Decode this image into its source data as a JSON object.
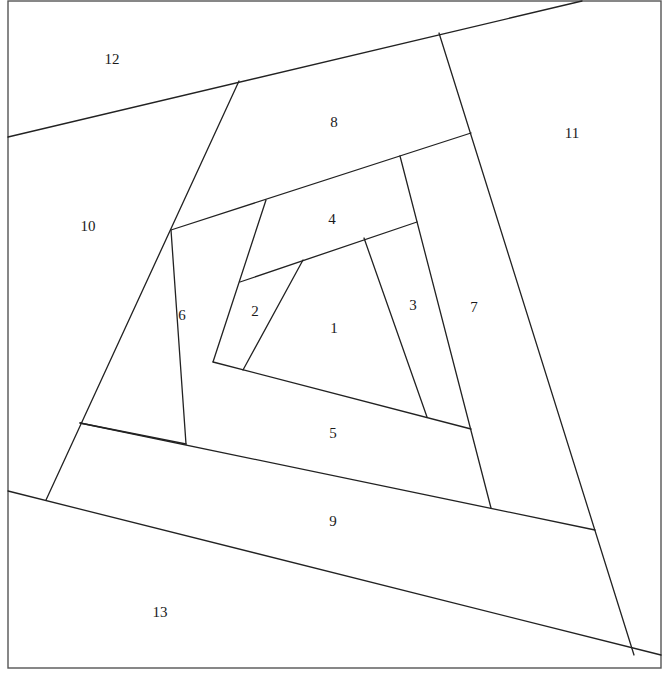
{
  "diagram": {
    "type": "log-cabin-spiral-quilt-block",
    "width": 671,
    "height": 674,
    "line_color": "#222222",
    "background": "#ffffff",
    "frame": {
      "x": 8,
      "y": 1,
      "w": 653,
      "h": 667
    },
    "segments": [
      [
        303,
        260,
        243,
        370
      ],
      [
        364,
        238,
        427,
        417
      ],
      [
        240,
        282,
        417,
        222
      ],
      [
        266,
        200,
        213,
        362
      ],
      [
        213,
        362,
        471,
        429
      ],
      [
        400,
        156,
        491,
        508
      ],
      [
        171,
        230,
        471,
        133
      ],
      [
        171,
        230,
        186,
        444
      ],
      [
        186,
        444,
        80,
        423
      ],
      [
        80,
        423,
        595,
        530
      ],
      [
        239,
        81,
        46,
        500
      ],
      [
        8,
        137,
        582,
        1
      ],
      [
        439,
        33,
        634,
        655
      ],
      [
        8,
        491,
        661,
        655
      ]
    ],
    "pieces": [
      {
        "id": "piece-1",
        "label": "1",
        "x": 334,
        "y": 330
      },
      {
        "id": "piece-2",
        "label": "2",
        "x": 255,
        "y": 313
      },
      {
        "id": "piece-3",
        "label": "3",
        "x": 413,
        "y": 307
      },
      {
        "id": "piece-4",
        "label": "4",
        "x": 332,
        "y": 221
      },
      {
        "id": "piece-5",
        "label": "5",
        "x": 333,
        "y": 435
      },
      {
        "id": "piece-6",
        "label": "6",
        "x": 182,
        "y": 317
      },
      {
        "id": "piece-7",
        "label": "7",
        "x": 474,
        "y": 309
      },
      {
        "id": "piece-8",
        "label": "8",
        "x": 334,
        "y": 124
      },
      {
        "id": "piece-9",
        "label": "9",
        "x": 333,
        "y": 523
      },
      {
        "id": "piece-10",
        "label": "10",
        "x": 88,
        "y": 228
      },
      {
        "id": "piece-11",
        "label": "11",
        "x": 572,
        "y": 135
      },
      {
        "id": "piece-12",
        "label": "12",
        "x": 112,
        "y": 61
      },
      {
        "id": "piece-13",
        "label": "13",
        "x": 160,
        "y": 614
      }
    ]
  }
}
